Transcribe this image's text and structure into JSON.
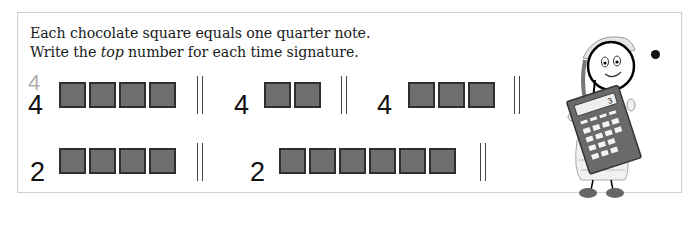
{
  "instructions": {
    "line1": "Each chocolate square equals one quarter note.",
    "line2_prefix": "Write the ",
    "line2_emphasis": "top",
    "line2_suffix": " number for each time signature."
  },
  "exercises": [
    {
      "row": 1,
      "top_number_example": "4",
      "bottom_number": "4",
      "squares": 4
    },
    {
      "row": 1,
      "top_number_example": "",
      "bottom_number": "4",
      "squares": 2
    },
    {
      "row": 1,
      "top_number_example": "",
      "bottom_number": "4",
      "squares": 3
    },
    {
      "row": 2,
      "top_number_example": "",
      "bottom_number": "2",
      "squares": 4
    },
    {
      "row": 2,
      "top_number_example": "",
      "bottom_number": "2",
      "squares": 6
    }
  ],
  "illustration": {
    "description": "girl holding calculator",
    "calculator_display": "3"
  },
  "colors": {
    "square_fill": "#6e6e6e",
    "square_border": "#2e2e2e",
    "hint_number": "#b0b0b0",
    "frame_border": "#cfcfcf"
  }
}
